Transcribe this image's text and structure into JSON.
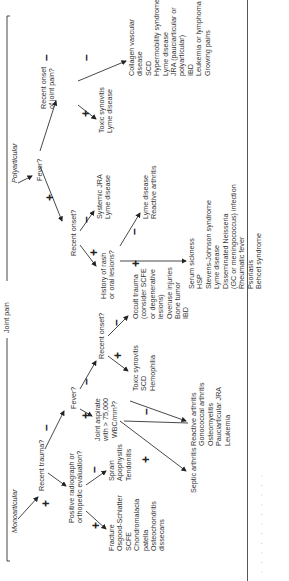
{
  "root": "Joint pain",
  "branches": {
    "mono": "Monoarticular",
    "poly": "Polyarticular"
  },
  "questions": {
    "recent_trauma": "Recent trauma?",
    "positive_radiograph": [
      "Positive radiograph or",
      "orthopedic evaluation?"
    ],
    "fever_mono": "Fever?",
    "joint_aspirate": [
      "Joint aspirate",
      "with > 75,000",
      "WBC/mm³?"
    ],
    "recent_onset_mono": "Recent onset?",
    "fever_poly": "Fever?",
    "recent_onset_poly": "Recent onset?",
    "history_rash": [
      "History of rash",
      "or oral lesions?"
    ],
    "recent_onset_joint_pain": [
      "Recent onset",
      "of joint pain?"
    ]
  },
  "outcomes": {
    "fracture": [
      "Fracture",
      "Osgood-Schlatter",
      "SCFE",
      "Chondromalacia",
      "   patella",
      "Osteochondritis",
      "   dissecans"
    ],
    "sprain": [
      "Sprain",
      "Apophysitis",
      "Tendonitis"
    ],
    "septic": [
      "Septic arthritis"
    ],
    "reactive": [
      "Reactive arthritis",
      "Gonococcal arthritis",
      "Osteomyelitis",
      "Pauciarticular JRA",
      "Leukemia"
    ],
    "toxic_mono": [
      "Toxic synovitis",
      "SCD",
      "Hemophilia"
    ],
    "occult": [
      "Occult trauma",
      "   (consider SCFE",
      "   or degenerative",
      "   lesions)",
      "Overuse injuries",
      "Bone tumor",
      "IBD"
    ],
    "systemic_jra": [
      "Systemic JRA",
      "Lyme disease"
    ],
    "lyme_reactive": [
      "Lyme disease",
      "Reactive arthritis"
    ],
    "serum": [
      "Serum sickness",
      "HSP",
      "Stevens-Johnson syndrome",
      "Lyme disease",
      "Disseminated Neisseria",
      "   (GC or meningococcus) infection",
      "Rheumatic fever",
      "Psoriasis",
      "Behcet syndrome"
    ],
    "toxic_poly": [
      "Toxic synovitis",
      "Lyme disease"
    ],
    "collagen": [
      "Collagen vascular",
      "   disease",
      "SCD",
      "Hypermobility syndrome",
      "Lyme disease",
      "JRA (pauciarticular or",
      "   polyarticular)",
      "IBD",
      "Leukemia or lymphoma",
      "Growing pains"
    ]
  },
  "signs": {
    "plus": "+",
    "minus": "–"
  },
  "caption": ". . .  . . . .  .  .   .  ."
}
